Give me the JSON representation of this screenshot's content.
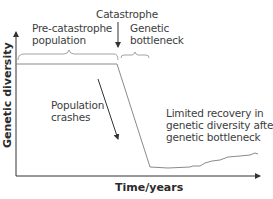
{
  "diagram": {
    "x_axis_label": "Time/years",
    "y_axis_label": "Genetic diversity",
    "annotations": {
      "pre_catastrophe": [
        "Pre-catastrophe",
        "population"
      ],
      "catastrophe": "Catastrophe",
      "bottleneck": [
        "Genetic",
        "bottleneck"
      ],
      "population_crashes": [
        "Population",
        "crashes"
      ],
      "limited_recovery": [
        "Limited recovery in",
        "genetic diversity after",
        "genetic bottleneck"
      ]
    },
    "colors": {
      "line": "#7a7a7a",
      "axis": "#333333",
      "text": "#3d3d3d"
    }
  }
}
